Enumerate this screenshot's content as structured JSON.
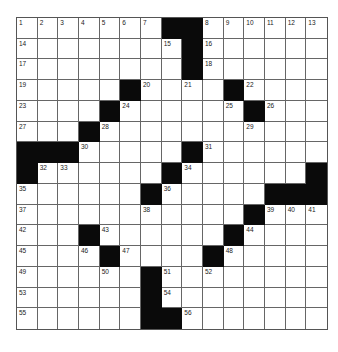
{
  "puzzle": {
    "size": {
      "rows": 15,
      "cols": 15
    },
    "colors": {
      "black": "#0a0a0a",
      "white": "#ffffff",
      "line": "#666666"
    },
    "rows": [
      "#######..######",
      "...............",
      "..............."
    ],
    "grid": [
      [
        ".",
        ".",
        ".",
        ".",
        ".",
        ".",
        ".",
        "#",
        "#",
        ".",
        ".",
        ".",
        ".",
        ".",
        "."
      ],
      [
        ".",
        ".",
        ".",
        ".",
        ".",
        ".",
        ".",
        ".",
        "#",
        ".",
        ".",
        ".",
        ".",
        ".",
        "."
      ],
      [
        ".",
        ".",
        ".",
        ".",
        ".",
        ".",
        ".",
        ".",
        "#",
        ".",
        ".",
        ".",
        ".",
        ".",
        "."
      ],
      [
        ".",
        ".",
        ".",
        ".",
        ".",
        "#",
        ".",
        ".",
        ".",
        ".",
        "#",
        ".",
        ".",
        ".",
        "."
      ],
      [
        ".",
        ".",
        ".",
        ".",
        "#",
        ".",
        ".",
        ".",
        ".",
        ".",
        ".",
        "#",
        ".",
        ".",
        "."
      ],
      [
        ".",
        ".",
        ".",
        "#",
        ".",
        ".",
        ".",
        ".",
        ".",
        ".",
        ".",
        ".",
        ".",
        ".",
        "."
      ],
      [
        "#",
        "#",
        "#",
        ".",
        ".",
        ".",
        ".",
        ".",
        "#",
        ".",
        ".",
        ".",
        ".",
        ".",
        "."
      ],
      [
        "#",
        ".",
        ".",
        ".",
        ".",
        ".",
        ".",
        "#",
        ".",
        ".",
        ".",
        ".",
        ".",
        ".",
        "#"
      ],
      [
        ".",
        ".",
        ".",
        ".",
        ".",
        ".",
        "#",
        ".",
        ".",
        ".",
        ".",
        ".",
        "#",
        "#",
        "#"
      ],
      [
        ".",
        ".",
        ".",
        ".",
        ".",
        ".",
        ".",
        ".",
        ".",
        ".",
        ".",
        "#",
        ".",
        ".",
        "."
      ],
      [
        ".",
        ".",
        ".",
        "#",
        ".",
        ".",
        ".",
        ".",
        ".",
        ".",
        "#",
        ".",
        ".",
        ".",
        "."
      ],
      [
        ".",
        ".",
        ".",
        ".",
        "#",
        ".",
        ".",
        ".",
        ".",
        "#",
        ".",
        ".",
        ".",
        ".",
        "."
      ],
      [
        ".",
        ".",
        ".",
        ".",
        ".",
        ".",
        "#",
        ".",
        ".",
        ".",
        ".",
        ".",
        ".",
        ".",
        "."
      ],
      [
        ".",
        ".",
        ".",
        ".",
        ".",
        ".",
        "#",
        ".",
        ".",
        ".",
        ".",
        ".",
        ".",
        ".",
        "."
      ],
      [
        ".",
        ".",
        ".",
        ".",
        ".",
        ".",
        "#",
        "#",
        ".",
        ".",
        ".",
        ".",
        ".",
        ".",
        "."
      ]
    ],
    "numbers": [
      {
        "r": 0,
        "c": 0,
        "n": "1"
      },
      {
        "r": 0,
        "c": 1,
        "n": "2"
      },
      {
        "r": 0,
        "c": 2,
        "n": "3"
      },
      {
        "r": 0,
        "c": 3,
        "n": "4"
      },
      {
        "r": 0,
        "c": 4,
        "n": "5"
      },
      {
        "r": 0,
        "c": 5,
        "n": "6"
      },
      {
        "r": 0,
        "c": 6,
        "n": "7"
      },
      {
        "r": 0,
        "c": 9,
        "n": "8"
      },
      {
        "r": 0,
        "c": 10,
        "n": "9"
      },
      {
        "r": 0,
        "c": 11,
        "n": "10"
      },
      {
        "r": 0,
        "c": 12,
        "n": "11"
      },
      {
        "r": 0,
        "c": 13,
        "n": "12"
      },
      {
        "r": 0,
        "c": 14,
        "n": "13"
      },
      {
        "r": 1,
        "c": 0,
        "n": "14"
      },
      {
        "r": 1,
        "c": 7,
        "n": "15"
      },
      {
        "r": 1,
        "c": 9,
        "n": "16"
      },
      {
        "r": 2,
        "c": 0,
        "n": "17"
      },
      {
        "r": 2,
        "c": 9,
        "n": "18"
      },
      {
        "r": 3,
        "c": 0,
        "n": "19"
      },
      {
        "r": 3,
        "c": 6,
        "n": "20"
      },
      {
        "r": 3,
        "c": 8,
        "n": "21"
      },
      {
        "r": 3,
        "c": 11,
        "n": "22"
      },
      {
        "r": 4,
        "c": 0,
        "n": "23"
      },
      {
        "r": 4,
        "c": 5,
        "n": "24"
      },
      {
        "r": 4,
        "c": 10,
        "n": "25"
      },
      {
        "r": 4,
        "c": 12,
        "n": "26"
      },
      {
        "r": 5,
        "c": 0,
        "n": "27"
      },
      {
        "r": 5,
        "c": 4,
        "n": "28"
      },
      {
        "r": 5,
        "c": 11,
        "n": "29"
      },
      {
        "r": 6,
        "c": 3,
        "n": "30"
      },
      {
        "r": 6,
        "c": 9,
        "n": "31"
      },
      {
        "r": 7,
        "c": 1,
        "n": "32"
      },
      {
        "r": 7,
        "c": 2,
        "n": "33"
      },
      {
        "r": 7,
        "c": 8,
        "n": "34"
      },
      {
        "r": 8,
        "c": 0,
        "n": "35"
      },
      {
        "r": 8,
        "c": 7,
        "n": "36"
      },
      {
        "r": 9,
        "c": 0,
        "n": "37"
      },
      {
        "r": 9,
        "c": 6,
        "n": "38"
      },
      {
        "r": 9,
        "c": 12,
        "n": "39"
      },
      {
        "r": 9,
        "c": 13,
        "n": "40"
      },
      {
        "r": 9,
        "c": 14,
        "n": "41"
      },
      {
        "r": 10,
        "c": 0,
        "n": "42"
      },
      {
        "r": 10,
        "c": 4,
        "n": "43"
      },
      {
        "r": 10,
        "c": 11,
        "n": "44"
      },
      {
        "r": 11,
        "c": 0,
        "n": "45"
      },
      {
        "r": 11,
        "c": 3,
        "n": "46"
      },
      {
        "r": 11,
        "c": 5,
        "n": "47"
      },
      {
        "r": 11,
        "c": 10,
        "n": "48"
      },
      {
        "r": 12,
        "c": 0,
        "n": "49"
      },
      {
        "r": 12,
        "c": 4,
        "n": "50"
      },
      {
        "r": 12,
        "c": 7,
        "n": "51"
      },
      {
        "r": 12,
        "c": 9,
        "n": "52"
      },
      {
        "r": 13,
        "c": 0,
        "n": "53"
      },
      {
        "r": 13,
        "c": 7,
        "n": "54"
      },
      {
        "r": 14,
        "c": 0,
        "n": "55"
      },
      {
        "r": 14,
        "c": 8,
        "n": "56"
      }
    ]
  }
}
